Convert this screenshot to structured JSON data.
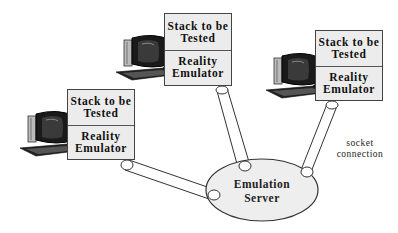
{
  "diagram": {
    "clients": [
      {
        "id": "client-left",
        "top_label": "Stack to be Tested",
        "bottom_label": "Reality Emulator",
        "icon": "desktop-computer-icon"
      },
      {
        "id": "client-middle",
        "top_label": "Stack to be Tested",
        "bottom_label": "Reality Emulator",
        "icon": "desktop-computer-icon"
      },
      {
        "id": "client-right",
        "top_label": "Stack to be Tested",
        "bottom_label": "Reality Emulator",
        "icon": "desktop-computer-icon"
      }
    ],
    "server": {
      "label_line1": "Emulation",
      "label_line2": "Server"
    },
    "connection_label": {
      "line1": "socket",
      "line2": "connection"
    },
    "colors": {
      "box_fill": "#ececec",
      "server_fill": "#eeeeee",
      "stroke": "#333333"
    }
  }
}
